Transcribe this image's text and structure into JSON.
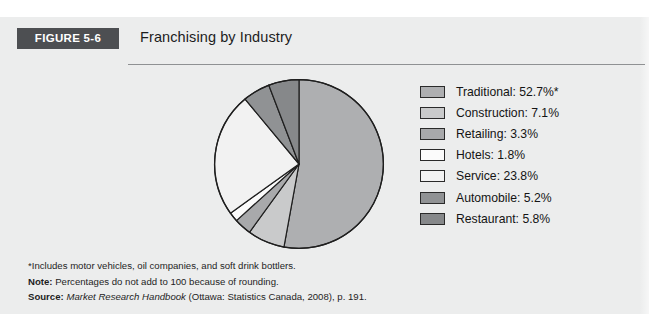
{
  "figure": {
    "banner_label": "FIGURE 5-6",
    "title": "Franchising by Industry"
  },
  "chart_data": {
    "type": "pie",
    "title": "Franchising by Industry",
    "categories": [
      "Traditional",
      "Construction",
      "Retailing",
      "Hotels",
      "Service",
      "Automobile",
      "Restaurant"
    ],
    "values": [
      52.7,
      7.1,
      3.3,
      1.8,
      23.8,
      5.2,
      5.8
    ],
    "units": "percent",
    "legend_position": "right",
    "start_angle_deg": 0,
    "direction": "clockwise",
    "slice_colors": [
      "#aeafb1",
      "#c9cacb",
      "#a8a9ab",
      "#fbfbfb",
      "#f2f2f2",
      "#909294",
      "#86888a"
    ],
    "slice_stroke": "#1f1f1f",
    "legend_entries": [
      {
        "label": "Traditional: 52.7%*",
        "swatch": "#aeafb1",
        "value": 52.7
      },
      {
        "label": "Construction: 7.1%",
        "swatch": "#c9cacb",
        "value": 7.1
      },
      {
        "label": "Retailing: 3.3%",
        "swatch": "#a8a9ab",
        "value": 3.3
      },
      {
        "label": "Hotels: 1.8%",
        "swatch": "#fbfbfb",
        "value": 1.8
      },
      {
        "label": "Service: 23.8%",
        "swatch": "#f2f2f2",
        "value": 23.8
      },
      {
        "label": "Automobile: 5.2%",
        "swatch": "#909294",
        "value": 5.2
      },
      {
        "label": "Restaurant: 5.8%",
        "swatch": "#86888a",
        "value": 5.8
      }
    ]
  },
  "footnotes": {
    "asterisk": "*Includes motor vehicles, oil companies, and soft drink bottlers.",
    "note_label": "Note:",
    "note_text": "Percentages do not add to 100 because of rounding.",
    "source_label": "Source:",
    "source_italic": "Market Research Handbook",
    "source_rest": "(Ottawa: Statistics Canada, 2008), p. 191."
  },
  "colors": {
    "panel_background": "#eceded",
    "banner_background": "#4d4f52",
    "rule": "#8f9193",
    "text": "#141414"
  }
}
